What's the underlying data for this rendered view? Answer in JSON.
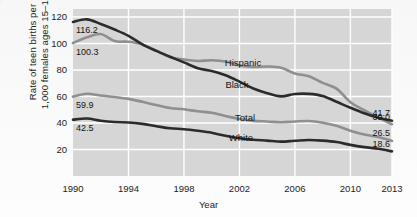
{
  "chart_data": {
    "type": "line",
    "title": "",
    "xlabel": "Year",
    "ylabel": "Rate of teen births per 1,000 females ages 15–19",
    "ylabel_line1": "Rate of teen births per",
    "ylabel_line2": "1,000 females ages 15–19",
    "xlim": [
      1990,
      2013
    ],
    "ylim": [
      0,
      126
    ],
    "yticks": [
      20,
      40,
      60,
      80,
      100,
      120
    ],
    "xticks": [
      1990,
      1994,
      1998,
      2002,
      2006,
      2010,
      2013
    ],
    "gridlines": {
      "x": true,
      "y": true,
      "color": "#ffffff"
    },
    "plot_background": "#d6d6d6",
    "legend": "inline-labels",
    "x": [
      1990,
      1991,
      1992,
      1993,
      1994,
      1995,
      1996,
      1997,
      1998,
      1999,
      2000,
      2001,
      2002,
      2003,
      2004,
      2005,
      2006,
      2007,
      2008,
      2009,
      2010,
      2011,
      2012,
      2013
    ],
    "series": [
      {
        "name": "Black",
        "color": "#2b2b2b",
        "label": "Black",
        "start_value": 116.2,
        "end_value": 41.7,
        "values": [
          116.2,
          118.2,
          114.7,
          110.5,
          105.7,
          99.3,
          94.4,
          90.0,
          85.7,
          81.3,
          79.2,
          76.0,
          71.2,
          66.0,
          62.5,
          60.1,
          61.9,
          62.0,
          60.4,
          56.0,
          51.5,
          47.3,
          43.9,
          41.7
        ]
      },
      {
        "name": "Hispanic",
        "color": "#8f8f8f",
        "label": "Hispanic",
        "start_value": 100.3,
        "end_value": 39.0,
        "values": [
          100.3,
          104.6,
          107.1,
          101.8,
          101.3,
          99.3,
          94.6,
          89.6,
          87.9,
          86.8,
          87.3,
          86.4,
          83.4,
          82.3,
          82.6,
          81.7,
          77.4,
          75.3,
          70.3,
          65.9,
          55.7,
          49.6,
          44.0,
          39.0
        ]
      },
      {
        "name": "Total",
        "color": "#8f8f8f",
        "label": "Total",
        "start_value": 59.9,
        "end_value": 26.5,
        "values": [
          59.9,
          62.1,
          60.7,
          59.6,
          58.2,
          56.0,
          53.5,
          51.3,
          50.3,
          48.8,
          47.7,
          45.3,
          43.0,
          41.6,
          41.1,
          40.5,
          41.1,
          41.5,
          40.2,
          37.9,
          34.2,
          31.3,
          29.4,
          26.5
        ]
      },
      {
        "name": "White",
        "color": "#2b2b2b",
        "label": "White",
        "start_value": 42.5,
        "end_value": 18.6,
        "values": [
          42.5,
          43.4,
          41.7,
          40.7,
          40.4,
          39.3,
          37.6,
          36.0,
          35.3,
          34.1,
          32.6,
          30.3,
          28.5,
          27.4,
          26.7,
          25.9,
          26.6,
          27.2,
          26.7,
          25.6,
          23.5,
          21.8,
          20.5,
          18.6
        ]
      }
    ],
    "value_labels": [
      {
        "text": "116.2",
        "series": "Black",
        "side": "left"
      },
      {
        "text": "100.3",
        "series": "Hispanic",
        "side": "left"
      },
      {
        "text": "59.9",
        "series": "Total",
        "side": "left"
      },
      {
        "text": "42.5",
        "series": "White",
        "side": "left"
      },
      {
        "text": "41.7",
        "series": "Black",
        "side": "right"
      },
      {
        "text": "39.0",
        "series": "Hispanic",
        "side": "right"
      },
      {
        "text": "26.5",
        "series": "Total",
        "side": "right"
      },
      {
        "text": "18.6",
        "series": "White",
        "side": "right"
      }
    ]
  }
}
